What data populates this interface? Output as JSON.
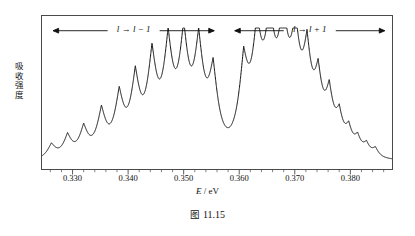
{
  "figure": {
    "caption_label": "图",
    "caption_number": "11.15"
  },
  "axes": {
    "ylabel": "吸收强度",
    "xlabel_symbol": "E",
    "xlabel_sep": " / ",
    "xlabel_unit": "eV",
    "xtick_labels": [
      "0.330",
      "0.340",
      "0.350",
      "0.360",
      "0.370",
      "0.380"
    ],
    "xtick_values": [
      0.33,
      0.34,
      0.35,
      0.36,
      0.37,
      0.38
    ],
    "xlim": [
      0.3245,
      0.3875
    ],
    "minor_tick_step": 0.002
  },
  "annotations": [
    {
      "name": "branch-left",
      "text_pre": "l",
      "arrow_glyph": "→",
      "text_post": "l − 1",
      "x_start": 0.3265,
      "x_end": 0.3555,
      "y_frac": 0.93
    },
    {
      "name": "branch-right",
      "text_pre": "l",
      "arrow_glyph": "→",
      "text_post": "l + 1",
      "x_start": 0.3592,
      "x_end": 0.3862,
      "y_frac": 0.93
    }
  ],
  "colors": {
    "trace": "#111111",
    "frame": "#4a4a4a",
    "text": "#111111",
    "background": "#ffffff"
  },
  "chart_data": {
    "type": "line",
    "title": "",
    "xlabel": "E / eV",
    "ylabel": "吸收强度",
    "xlim": [
      0.3245,
      0.3875
    ],
    "ylim": [
      0,
      1.0
    ],
    "grid": false,
    "legend": "none",
    "series": [
      {
        "name": "absorption",
        "peaks": [
          {
            "x": 0.3262,
            "height": 0.115,
            "width": 0.00115
          },
          {
            "x": 0.3291,
            "height": 0.175,
            "width": 0.00115
          },
          {
            "x": 0.332,
            "height": 0.23,
            "width": 0.0012
          },
          {
            "x": 0.3352,
            "height": 0.35,
            "width": 0.00125
          },
          {
            "x": 0.3384,
            "height": 0.455,
            "width": 0.0013
          },
          {
            "x": 0.3413,
            "height": 0.57,
            "width": 0.0013
          },
          {
            "x": 0.3443,
            "height": 0.72,
            "width": 0.00135
          },
          {
            "x": 0.3472,
            "height": 0.8,
            "width": 0.00135
          },
          {
            "x": 0.35,
            "height": 0.84,
            "width": 0.00135
          },
          {
            "x": 0.3527,
            "height": 0.79,
            "width": 0.00135
          },
          {
            "x": 0.3553,
            "height": 0.61,
            "width": 0.0013
          },
          {
            "x": 0.3608,
            "height": 0.66,
            "width": 0.0013
          },
          {
            "x": 0.3632,
            "height": 0.83,
            "width": 0.00135
          },
          {
            "x": 0.3655,
            "height": 0.895,
            "width": 0.00135
          },
          {
            "x": 0.3679,
            "height": 0.905,
            "width": 0.00135
          },
          {
            "x": 0.3701,
            "height": 0.79,
            "width": 0.0013
          },
          {
            "x": 0.3722,
            "height": 0.68,
            "width": 0.00125
          },
          {
            "x": 0.3742,
            "height": 0.5,
            "width": 0.0012
          },
          {
            "x": 0.3762,
            "height": 0.415,
            "width": 0.00115
          },
          {
            "x": 0.378,
            "height": 0.255,
            "width": 0.00105
          },
          {
            "x": 0.3797,
            "height": 0.175,
            "width": 0.001
          },
          {
            "x": 0.3813,
            "height": 0.125,
            "width": 0.00095
          },
          {
            "x": 0.3829,
            "height": 0.09,
            "width": 0.0009
          },
          {
            "x": 0.3845,
            "height": 0.07,
            "width": 0.00085
          }
        ],
        "baseline": 0.035,
        "notes": "Two magneto-optical absorption branches; central gap between 0.3553 and 0.3608 eV"
      }
    ]
  }
}
